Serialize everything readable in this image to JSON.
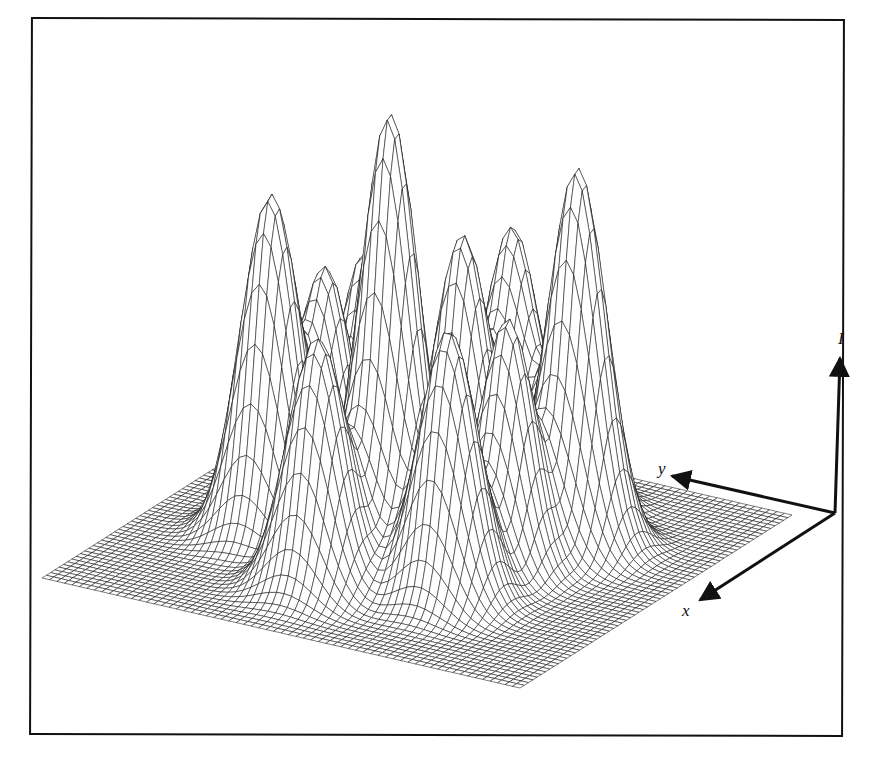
{
  "chart_data": {
    "type": "surface",
    "title": "",
    "axes": {
      "vertical": {
        "label": "I"
      },
      "depth": {
        "label": "y"
      },
      "front": {
        "label": "x"
      }
    },
    "grid": {
      "resolution": 64,
      "hidden_line_removal": true
    },
    "projection": {
      "corner_right": [
        792,
        515
      ],
      "corner_front": [
        520,
        688
      ],
      "corner_back": [
        314,
        405
      ],
      "height_scale": 1.0
    },
    "peaks": [
      {
        "s": 0.6,
        "t": 0.75,
        "height": 340,
        "sigma": 0.055
      },
      {
        "s": 0.6,
        "t": 0.5,
        "height": 450,
        "sigma": 0.055
      },
      {
        "s": 0.35,
        "t": 0.25,
        "height": 380,
        "sigma": 0.055
      },
      {
        "s": 0.45,
        "t": 0.72,
        "height": 238,
        "sigma": 0.05
      },
      {
        "s": 0.3,
        "t": 0.72,
        "height": 235,
        "sigma": 0.05
      },
      {
        "s": 0.3,
        "t": 0.52,
        "height": 272,
        "sigma": 0.05
      },
      {
        "s": 0.15,
        "t": 0.5,
        "height": 256,
        "sigma": 0.05
      },
      {
        "s": 0.2,
        "t": 0.35,
        "height": 219,
        "sigma": 0.05
      },
      {
        "s": 0.78,
        "t": 0.55,
        "height": 250,
        "sigma": 0.055
      },
      {
        "s": 0.7,
        "t": 0.32,
        "height": 270,
        "sigma": 0.055
      },
      {
        "s": 0.52,
        "t": 0.3,
        "height": 250,
        "sigma": 0.05
      }
    ]
  },
  "axis_labels": {
    "intensity": "I",
    "y": "y",
    "x": "x"
  },
  "colors": {
    "line": "#111111",
    "fill": "#ffffff",
    "frame": "#111111"
  }
}
